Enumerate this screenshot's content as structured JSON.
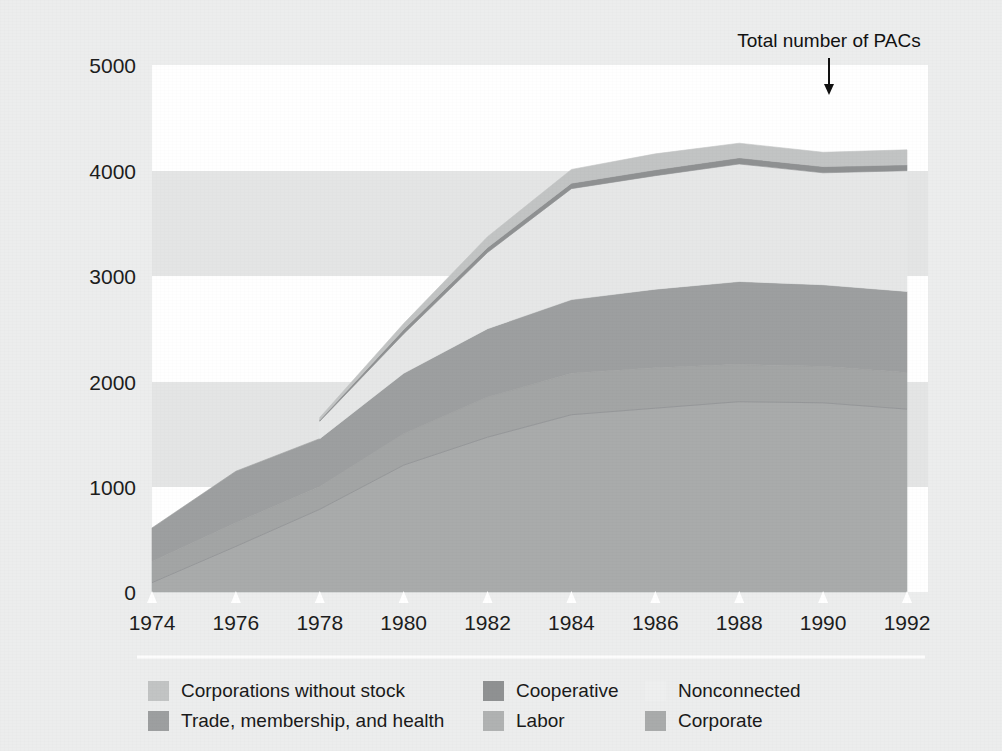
{
  "figure": {
    "background_color": "#eceded",
    "band_light_color": "#ffffff",
    "band_gray_color": "#e4e5e5",
    "annotation": {
      "text": "Total number of PACs",
      "arrow_icon": "down-arrow-icon",
      "points_at_year": 1990
    },
    "legend_divider_color": "#fdfdfd"
  },
  "chart_data": {
    "type": "area",
    "stacked": true,
    "title": "",
    "xlabel": "",
    "ylabel": "",
    "x": [
      1974,
      1976,
      1978,
      1980,
      1982,
      1984,
      1986,
      1988,
      1990,
      1992
    ],
    "xlim": [
      1974,
      1992
    ],
    "ylim": [
      0,
      5000
    ],
    "yticks": [
      0,
      1000,
      2000,
      3000,
      4000,
      5000
    ],
    "xticks": [
      1974,
      1976,
      1978,
      1980,
      1982,
      1984,
      1986,
      1988,
      1990,
      1992
    ],
    "ytick_labels": [
      "0",
      "1000",
      "2000",
      "3000",
      "4000",
      "5000"
    ],
    "xtick_labels": [
      "1974",
      "1976",
      "1978",
      "1980",
      "1982",
      "1984",
      "1986",
      "1988",
      "1990",
      "1992"
    ],
    "grid": false,
    "banded_background": true,
    "legend_position": "below",
    "series": [
      {
        "name": "Corporate",
        "color": "#a9abab",
        "order": 1,
        "values": [
          89,
          433,
          785,
          1204,
          1469,
          1682,
          1744,
          1806,
          1795,
          1735
        ]
      },
      {
        "name": "Labor",
        "color": "#a3a5a5",
        "order": 2,
        "values": [
          201,
          224,
          217,
          297,
          380,
          394,
          384,
          354,
          346,
          347
        ]
      },
      {
        "name": "Trade, membership, and health",
        "color": "#9d9fa0",
        "order": 3,
        "values": [
          318,
          489,
          453,
          574,
          649,
          698,
          745,
          786,
          774,
          770
        ]
      },
      {
        "name": "Nonconnected",
        "color": "#e6e7e7",
        "order": 4,
        "values": [
          0,
          0,
          165,
          374,
          723,
          1053,
          1077,
          1115,
          1062,
          1145
        ]
      },
      {
        "name": "Cooperative",
        "color": "#8f9192",
        "order": 5,
        "values": [
          0,
          0,
          12,
          42,
          47,
          52,
          56,
          59,
          59,
          56
        ]
      },
      {
        "name": "Corporations without stock",
        "color": "#c2c4c4",
        "order": 6,
        "values": [
          0,
          0,
          24,
          56,
          103,
          130,
          151,
          138,
          136,
          142
        ]
      }
    ],
    "totals": [
      608,
      1146,
      1656,
      2547,
      3371,
      4009,
      4157,
      4258,
      4172,
      4195
    ]
  },
  "legend": {
    "items": [
      {
        "label": "Corporations without stock",
        "color": "#c2c4c4",
        "swatch": "swatch-corporations-without-stock"
      },
      {
        "label": "Cooperative",
        "color": "#8f9192",
        "swatch": "swatch-cooperative"
      },
      {
        "label": "Nonconnected",
        "color": "#eeefef",
        "swatch": "swatch-nonconnected"
      },
      {
        "label": "Trade, membership, and health",
        "color": "#9d9fa0",
        "swatch": "swatch-trade-membership-health"
      },
      {
        "label": "Labor",
        "color": "#b0b2b2",
        "swatch": "swatch-labor"
      },
      {
        "label": "Corporate",
        "color": "#a9abab",
        "swatch": "swatch-corporate"
      }
    ]
  }
}
